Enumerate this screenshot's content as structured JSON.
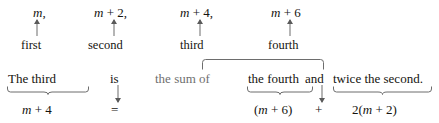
{
  "figure": {
    "kind": "algebra-translation-diagram",
    "background_color": "#ffffff",
    "ink_color": "#15140f",
    "dim_ink_color": "#6f6f6f",
    "rule_color": "#6d6d6d"
  },
  "expressions_row": {
    "label": "consecutive even integers",
    "items": [
      {
        "text": "m,",
        "variable": "m"
      },
      {
        "text": "m + 2,",
        "variable": "m"
      },
      {
        "text": "m + 4,",
        "variable": "m"
      },
      {
        "text": "m + 6",
        "variable": "m"
      }
    ]
  },
  "ordinals_row": {
    "items": [
      {
        "text": "first"
      },
      {
        "text": "second"
      },
      {
        "text": "third"
      },
      {
        "text": "fourth"
      }
    ]
  },
  "sentence_row": {
    "full_sentence": "The third is the sum of the fourth and twice the second.",
    "parts": [
      {
        "text": "The third",
        "emphasis": "normal"
      },
      {
        "text": "is",
        "emphasis": "normal"
      },
      {
        "text": "the sum of",
        "emphasis": "dim"
      },
      {
        "text": "the fourth",
        "emphasis": "normal"
      },
      {
        "text": "and",
        "emphasis": "normal"
      },
      {
        "text": "twice the second.",
        "emphasis": "normal"
      }
    ]
  },
  "equation_row": {
    "full_equation": "m + 4 = (m + 6) + 2(m + 2)",
    "parts": [
      {
        "text": "m + 4"
      },
      {
        "text": "="
      },
      {
        "text": "(m + 6)"
      },
      {
        "text": "+"
      },
      {
        "text": "2(m + 2)"
      }
    ]
  },
  "connectors": {
    "up_arrows": [
      {
        "from": "first",
        "to": "m,"
      },
      {
        "from": "second",
        "to": "m + 2,"
      },
      {
        "from": "third",
        "to": "m + 4,"
      },
      {
        "from": "fourth",
        "to": "m + 6"
      }
    ],
    "down_arrows": [
      {
        "from": "is",
        "to": "="
      },
      {
        "from": "and",
        "to": "+"
      }
    ],
    "underbraces": [
      {
        "spans": "The third",
        "yields": "m + 4"
      },
      {
        "spans": "the fourth",
        "yields": "(m + 6)"
      },
      {
        "spans": "twice the second.",
        "yields": "2(m + 2)"
      }
    ],
    "top_bracket": {
      "spans": "the fourth and twice the second.",
      "introduced_by": "the sum of"
    }
  }
}
